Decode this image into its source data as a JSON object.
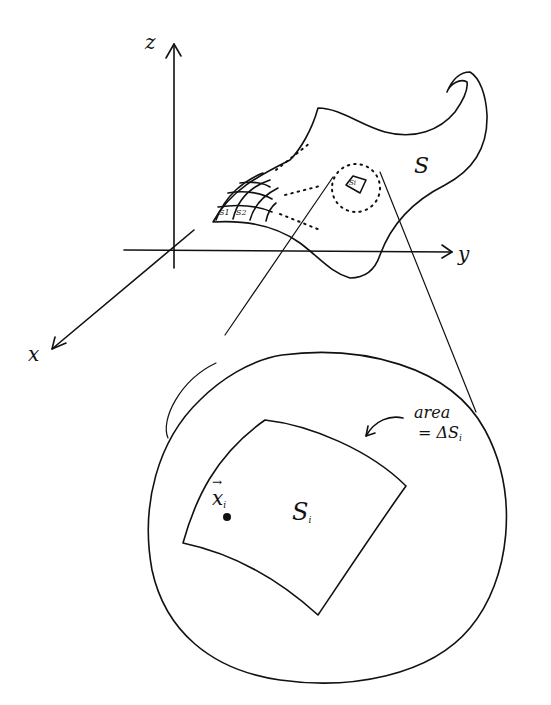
{
  "diagram": {
    "axes": {
      "z_label": "z",
      "y_label": "y",
      "x_label": "x"
    },
    "surface": {
      "label": "S",
      "patch_labels": [
        "S1",
        "S2"
      ],
      "highlighted_patch": "Si"
    },
    "magnified": {
      "patch_label": "S",
      "patch_subscript": "i",
      "point_label": "x",
      "point_subscript": "i",
      "point_vector_mark": "→",
      "annotation_line1": "area",
      "annotation_line2": "= ΔS",
      "annotation_subscript": "i"
    },
    "colors": {
      "ink": "#111111",
      "background": "#ffffff"
    }
  }
}
